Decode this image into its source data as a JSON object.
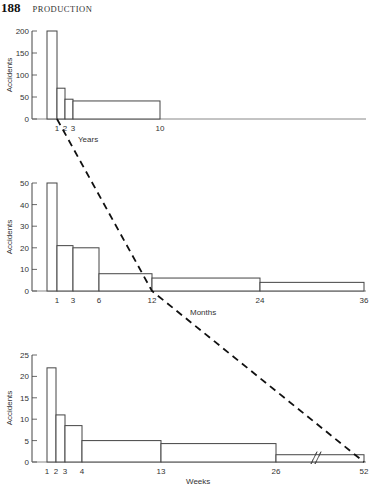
{
  "header": {
    "page_number": "188",
    "running_head": "PRODUCTION"
  },
  "chart_data": [
    {
      "type": "bar",
      "title": "",
      "xlabel": "Years",
      "ylabel": "Accidents",
      "ylim": [
        0,
        200
      ],
      "yticks": [
        0,
        50,
        100,
        150,
        200
      ],
      "xtick_labels": [
        "1",
        "2",
        "3",
        "10"
      ],
      "bins": [
        {
          "from": 0,
          "to": 1,
          "value": 200
        },
        {
          "from": 1,
          "to": 2,
          "value": 70
        },
        {
          "from": 2,
          "to": 3,
          "value": 45
        },
        {
          "from": 3,
          "to": 10,
          "value": 41
        }
      ],
      "layout": {
        "axis_x": 32,
        "y_top": 31,
        "y_base": 119,
        "x_end": 366,
        "bar_edges_px": [
          47,
          57,
          65,
          73,
          160
        ],
        "xtick_px": [
          57,
          65,
          73,
          160
        ],
        "xlabel_pos": [
          78,
          142
        ],
        "ylabel_pos": [
          12,
          75
        ]
      }
    },
    {
      "type": "bar",
      "title": "",
      "xlabel": "Months",
      "ylabel": "Accidents",
      "ylim": [
        0,
        50
      ],
      "yticks": [
        0,
        10,
        20,
        30,
        40,
        50
      ],
      "xtick_labels": [
        "1",
        "3",
        "6",
        "12",
        "24",
        "36"
      ],
      "bins": [
        {
          "from": 0,
          "to": 1,
          "value": 50
        },
        {
          "from": 1,
          "to": 3,
          "value": 21
        },
        {
          "from": 3,
          "to": 6,
          "value": 20
        },
        {
          "from": 6,
          "to": 12,
          "value": 8
        },
        {
          "from": 12,
          "to": 24,
          "value": 6
        },
        {
          "from": 24,
          "to": 36,
          "value": 4
        }
      ],
      "layout": {
        "axis_x": 32,
        "y_top": 183,
        "y_base": 291,
        "x_end": 366,
        "bar_edges_px": [
          47,
          57,
          73,
          99,
          152,
          260,
          364
        ],
        "xtick_px": [
          57,
          73,
          99,
          152,
          260,
          364
        ],
        "xlabel_pos": [
          190,
          315
        ],
        "ylabel_pos": [
          12,
          237
        ]
      }
    },
    {
      "type": "bar",
      "title": "",
      "xlabel": "Weeks",
      "ylabel": "Accidents",
      "ylim": [
        0,
        25
      ],
      "yticks": [
        0,
        5,
        10,
        15,
        20,
        25
      ],
      "xtick_labels": [
        "1",
        "2",
        "3",
        "4",
        "13",
        "26",
        "52"
      ],
      "bins": [
        {
          "from": 0,
          "to": 1,
          "value": 22
        },
        {
          "from": 1,
          "to": 2,
          "value": 11
        },
        {
          "from": 2,
          "to": 3,
          "value": 8.5
        },
        {
          "from": 3,
          "to": 13,
          "value": 5
        },
        {
          "from": 13,
          "to": 26,
          "value": 4.3
        },
        {
          "from": 26,
          "to": 52,
          "value": 1.7
        }
      ],
      "axis_break": {
        "between": [
          26,
          52
        ],
        "x_px": 314
      },
      "layout": {
        "axis_x": 32,
        "y_top": 355,
        "y_base": 462,
        "x_end": 366,
        "bar_edges_px": [
          47,
          56,
          65,
          82,
          161,
          276,
          364
        ],
        "xtick_px": [
          47,
          56,
          65,
          82,
          161,
          276,
          364
        ],
        "xlabel_pos": [
          186,
          484
        ],
        "ylabel_pos": [
          12,
          408
        ]
      }
    }
  ],
  "connector": {
    "style": "dashed",
    "description": "Dashed line linking 1 year -> 12 months -> 52 weeks",
    "points_px": [
      [
        57,
        119
      ],
      [
        152,
        291
      ],
      [
        364,
        462
      ]
    ]
  }
}
